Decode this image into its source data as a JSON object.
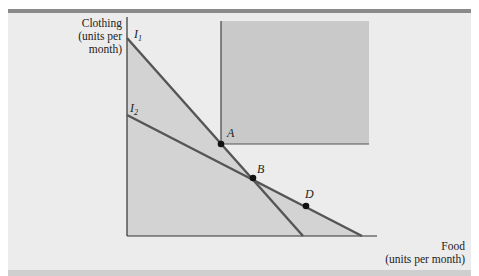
{
  "figure": {
    "y_axis_label": [
      "Clothing",
      "(units per",
      "month)"
    ],
    "x_axis_label": [
      "Food",
      "(units per month)"
    ],
    "curves": [
      {
        "name": "I",
        "sub": "1"
      },
      {
        "name": "I",
        "sub": "2"
      }
    ],
    "points": [
      {
        "label": "A"
      },
      {
        "label": "B"
      },
      {
        "label": "D"
      }
    ]
  },
  "colors": {
    "background": "#ececec",
    "shade": "#d2d2d2",
    "square": "#c9c9c9",
    "line": "#555555",
    "axis": "#333333",
    "point": "#111111"
  }
}
